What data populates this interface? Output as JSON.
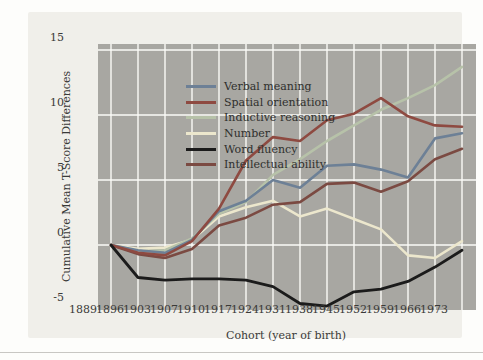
{
  "figure": {
    "xlabel": "Cohort (year of birth)",
    "ylabel": "Cumulative Mean T-Score Differences"
  },
  "colors": {
    "plot_background": "#a8a7a2",
    "panel_background": "#f0efea",
    "gridline": "#fbfbf7",
    "tick_text": "#3a3a38"
  },
  "chart_data": {
    "type": "line",
    "title": "",
    "xlabel": "Cohort (year of birth)",
    "ylabel": "Cumulative Mean T-Score Differences",
    "ylim": [
      -5,
      15
    ],
    "yticks": [
      15,
      10,
      5,
      0,
      -5
    ],
    "grid": true,
    "legend_position": "top-left",
    "categories": [
      "1889",
      "1896",
      "1903",
      "1907",
      "1910",
      "1917",
      "1924",
      "1931",
      "1938",
      "1945",
      "1952",
      "1959",
      "1966",
      "1973"
    ],
    "series": [
      {
        "name": "Verbal meaning",
        "color": "#6d8096",
        "values": [
          0,
          -0.4,
          -0.6,
          0.4,
          2.6,
          3.4,
          5.0,
          4.4,
          6.1,
          6.2,
          5.8,
          5.2,
          8.2,
          8.6
        ]
      },
      {
        "name": "Spatial orientation",
        "color": "#8e4a41",
        "values": [
          0,
          -0.6,
          -0.8,
          0.3,
          2.8,
          6.5,
          8.3,
          8.0,
          9.6,
          10.1,
          11.3,
          9.9,
          9.2,
          9.1
        ]
      },
      {
        "name": "Inductive reasoning",
        "color": "#b7c2a9",
        "values": [
          0,
          -0.5,
          -0.4,
          0.5,
          2.4,
          3.3,
          5.4,
          6.6,
          8.0,
          9.2,
          10.4,
          11.3,
          12.3,
          13.7
        ]
      },
      {
        "name": "Number",
        "color": "#ece7cd",
        "values": [
          0,
          -0.3,
          -0.2,
          0.4,
          2.2,
          2.9,
          3.4,
          2.2,
          2.8,
          2.0,
          1.2,
          -0.8,
          -1.0,
          0.3
        ]
      },
      {
        "name": "Word fluency",
        "color": "#1b1b1b",
        "values": [
          0,
          -2.5,
          -2.7,
          -2.6,
          -2.6,
          -2.7,
          -3.2,
          -4.5,
          -4.7,
          -3.6,
          -3.4,
          -2.8,
          -1.7,
          -0.4
        ]
      },
      {
        "name": "Intellectual ability",
        "color": "#7b4a42",
        "values": [
          0,
          -0.7,
          -1.0,
          -0.3,
          1.5,
          2.1,
          3.1,
          3.3,
          4.7,
          4.8,
          4.1,
          4.9,
          6.6,
          7.4
        ]
      }
    ]
  }
}
